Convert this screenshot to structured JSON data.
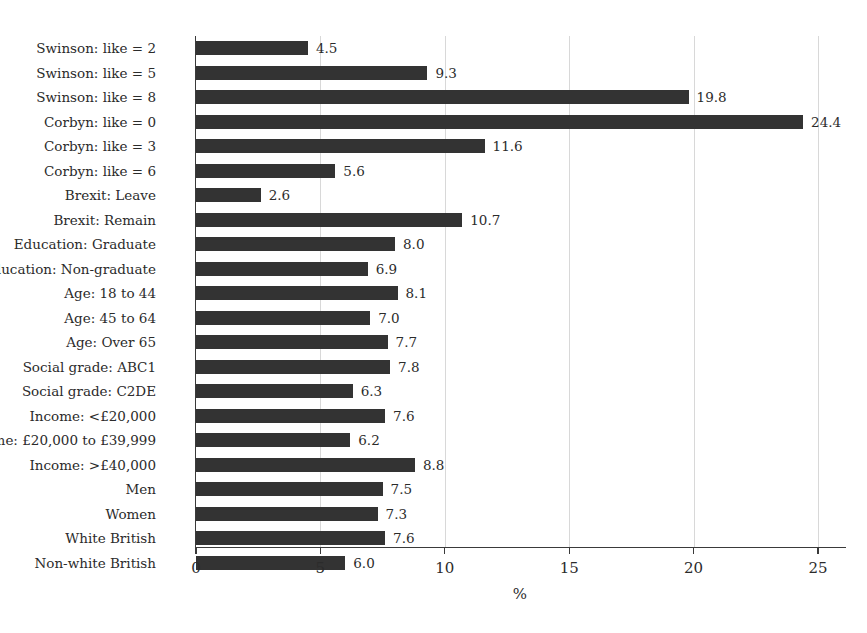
{
  "chart_data": {
    "type": "bar",
    "orientation": "horizontal",
    "title": "",
    "subtitle": "",
    "xlabel": "%",
    "ylabel": "",
    "xlim": [
      0,
      26.1
    ],
    "xticks": [
      0,
      5,
      10,
      15,
      20,
      25
    ],
    "xtick_labels": [
      "0",
      "5",
      "10",
      "15",
      "20",
      "25"
    ],
    "grid": "vertical",
    "legend": "none",
    "bar_color": "#333333",
    "axis_color": "#3a3a3a",
    "grid_color": "#d8d8d8",
    "text_color": "#2b2b2b",
    "categories": [
      "Swinson: like = 2",
      "Swinson: like = 5",
      "Swinson: like = 8",
      "Corbyn: like = 0",
      "Corbyn: like = 3",
      "Corbyn: like = 6",
      "Brexit: Leave",
      "Brexit: Remain",
      "Education: Graduate",
      "Education: Non-graduate",
      "Age: 18 to 44",
      "Age: 45 to 64",
      "Age: Over 65",
      "Social grade: ABC1",
      "Social grade: C2DE",
      "Income: <£20,000",
      "Income: £20,000 to £39,999",
      "Income: >£40,000",
      "Men",
      "Women",
      "White British",
      "Non-white British"
    ],
    "values": [
      4.5,
      9.3,
      19.8,
      24.4,
      11.6,
      5.6,
      2.6,
      10.7,
      8.0,
      6.9,
      8.1,
      7.0,
      7.7,
      7.8,
      6.3,
      7.6,
      6.2,
      8.8,
      7.5,
      7.3,
      7.6,
      6.0
    ],
    "value_labels": [
      "4.5",
      "9.3",
      "19.8",
      "24.4",
      "11.6",
      "5.6",
      "2.6",
      "10.7",
      "8.0",
      "6.9",
      "8.1",
      "7.0",
      "7.7",
      "7.8",
      "6.3",
      "7.6",
      "6.2",
      "8.8",
      "7.5",
      "7.3",
      "7.6",
      "6.0"
    ]
  }
}
